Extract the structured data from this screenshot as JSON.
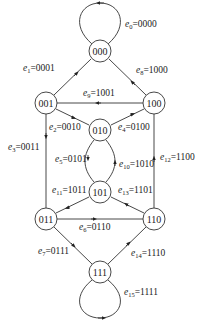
{
  "diagram": {
    "type": "de-bruijn-state-graph",
    "nodes": [
      {
        "id": "000",
        "x": 100,
        "y": 51
      },
      {
        "id": "001",
        "x": 46,
        "y": 103
      },
      {
        "id": "100",
        "x": 154,
        "y": 103
      },
      {
        "id": "010",
        "x": 100,
        "y": 130
      },
      {
        "id": "101",
        "x": 100,
        "y": 192
      },
      {
        "id": "011",
        "x": 46,
        "y": 219
      },
      {
        "id": "110",
        "x": 154,
        "y": 219
      },
      {
        "id": "111",
        "x": 100,
        "y": 272
      }
    ],
    "edges": [
      {
        "name": "e",
        "sub": "0",
        "value": "0000",
        "from": "000",
        "to": "000"
      },
      {
        "name": "e",
        "sub": "1",
        "value": "0001",
        "from": "000",
        "to": "001"
      },
      {
        "name": "e",
        "sub": "2",
        "value": "0010",
        "from": "001",
        "to": "010"
      },
      {
        "name": "e",
        "sub": "3",
        "value": "0011",
        "from": "001",
        "to": "011"
      },
      {
        "name": "e",
        "sub": "4",
        "value": "0100",
        "from": "010",
        "to": "100"
      },
      {
        "name": "e",
        "sub": "5",
        "value": "0101",
        "from": "010",
        "to": "101"
      },
      {
        "name": "e",
        "sub": "6",
        "value": "0110",
        "from": "011",
        "to": "110"
      },
      {
        "name": "e",
        "sub": "7",
        "value": "0111",
        "from": "011",
        "to": "111"
      },
      {
        "name": "e",
        "sub": "8",
        "value": "1000",
        "from": "100",
        "to": "000"
      },
      {
        "name": "e",
        "sub": "9",
        "value": "1001",
        "from": "100",
        "to": "001"
      },
      {
        "name": "e",
        "sub": "10",
        "value": "1010",
        "from": "101",
        "to": "010"
      },
      {
        "name": "e",
        "sub": "11",
        "value": "1011",
        "from": "101",
        "to": "011"
      },
      {
        "name": "e",
        "sub": "12",
        "value": "1100",
        "from": "110",
        "to": "100"
      },
      {
        "name": "e",
        "sub": "13",
        "value": "1101",
        "from": "110",
        "to": "101"
      },
      {
        "name": "e",
        "sub": "14",
        "value": "1110",
        "from": "111",
        "to": "110"
      },
      {
        "name": "e",
        "sub": "15",
        "value": "1111",
        "from": "111",
        "to": "111"
      }
    ],
    "labels": {
      "e0": {
        "n": "e",
        "s": "0",
        "v": "=0000"
      },
      "e1": {
        "n": "e",
        "s": "1",
        "v": "=0001"
      },
      "e2": {
        "n": "e",
        "s": "2",
        "v": "=0010"
      },
      "e3": {
        "n": "e",
        "s": "3",
        "v": "=0011"
      },
      "e4": {
        "n": "e",
        "s": "4",
        "v": "=0100"
      },
      "e5": {
        "n": "e",
        "s": "5",
        "v": "=0101"
      },
      "e6": {
        "n": "e",
        "s": "6",
        "v": "=0110"
      },
      "e7": {
        "n": "e",
        "s": "7",
        "v": "=0111"
      },
      "e8": {
        "n": "e",
        "s": "8",
        "v": "=1000"
      },
      "e9": {
        "n": "e",
        "s": "9",
        "v": "=1001"
      },
      "e10": {
        "n": "e",
        "s": "10",
        "v": "=1010"
      },
      "e11": {
        "n": "e",
        "s": "11",
        "v": "=1011"
      },
      "e12": {
        "n": "e",
        "s": "12",
        "v": "=1100"
      },
      "e13": {
        "n": "e",
        "s": "13",
        "v": "=1101"
      },
      "e14": {
        "n": "e",
        "s": "14",
        "v": "=1110"
      },
      "e15": {
        "n": "e",
        "s": "15",
        "v": "=1111"
      }
    },
    "node_labels": {
      "n000": "000",
      "n001": "001",
      "n100": "100",
      "n010": "010",
      "n101": "101",
      "n011": "011",
      "n110": "110",
      "n111": "111"
    }
  }
}
